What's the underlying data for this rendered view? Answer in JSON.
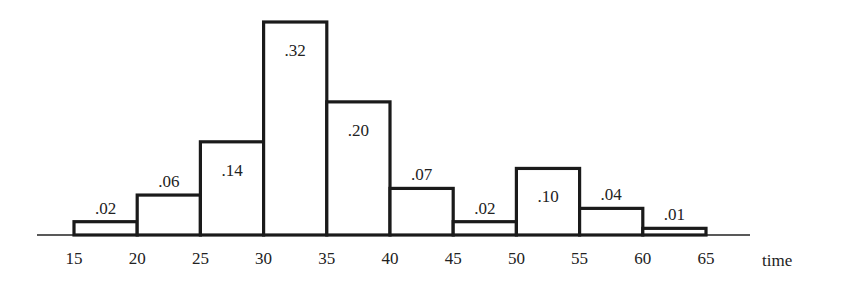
{
  "chart_data": {
    "type": "bar",
    "title": "",
    "xlabel": "time",
    "ylabel": "",
    "bin_edges": [
      15,
      20,
      25,
      30,
      35,
      40,
      45,
      50,
      55,
      60,
      65
    ],
    "categories": [
      "15-20",
      "20-25",
      "25-30",
      "30-35",
      "35-40",
      "40-45",
      "45-50",
      "50-55",
      "55-60",
      "60-65"
    ],
    "values": [
      0.02,
      0.06,
      0.14,
      0.32,
      0.2,
      0.07,
      0.02,
      0.1,
      0.04,
      0.01
    ],
    "value_labels": [
      ".02",
      ".06",
      ".14",
      ".32",
      ".20",
      ".07",
      ".02",
      ".10",
      ".04",
      ".01"
    ],
    "label_inside": [
      false,
      false,
      true,
      true,
      true,
      false,
      false,
      true,
      false,
      false
    ],
    "x_ticks": [
      "15",
      "20",
      "25",
      "30",
      "35",
      "40",
      "45",
      "50",
      "55",
      "60",
      "65"
    ],
    "xlim": [
      13.2,
      69.5
    ],
    "ylim": [
      0,
      0.32
    ],
    "grid": false,
    "legend": null
  }
}
